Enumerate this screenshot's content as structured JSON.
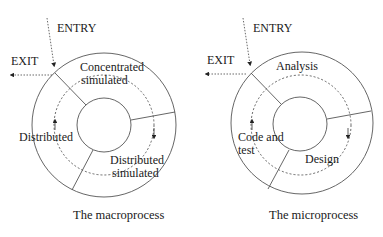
{
  "diagrams": [
    {
      "caption": "The macroprocess",
      "entry_label": "ENTRY",
      "exit_label": "EXIT",
      "phases": [
        {
          "label_lines": [
            "Concentrated",
            "simulated"
          ]
        },
        {
          "label_lines": [
            "Distributed",
            "simulated"
          ]
        },
        {
          "label_lines": [
            "Distributed"
          ]
        }
      ]
    },
    {
      "caption": "The microprocess",
      "entry_label": "ENTRY",
      "exit_label": "EXIT",
      "phases": [
        {
          "label_lines": [
            "Analysis"
          ]
        },
        {
          "label_lines": [
            "Design"
          ]
        },
        {
          "label_lines": [
            "Code and",
            "test"
          ]
        }
      ]
    }
  ]
}
